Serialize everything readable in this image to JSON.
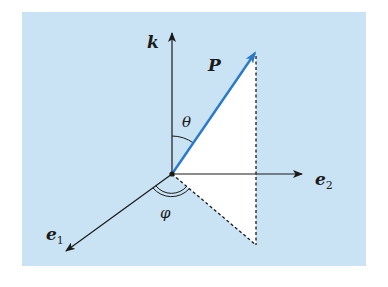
{
  "diagram": {
    "colors": {
      "background": "#c9e2f4",
      "page": "#ffffff",
      "vector": "#2a7ac8",
      "axes": "#1a1a1a",
      "projection_fill": "#ffffff"
    },
    "labels": {
      "k_axis": "k",
      "vector": "P",
      "theta": "θ",
      "e2_axis": "e",
      "e2_sub": "2",
      "e1_axis": "e",
      "e1_sub": "1",
      "phi": "φ"
    },
    "nodes": [
      {
        "id": "origin",
        "x": 172,
        "y": 174
      },
      {
        "id": "k_tip",
        "x": 172,
        "y": 33
      },
      {
        "id": "e2_tip",
        "x": 302,
        "y": 174
      },
      {
        "id": "e1_tip",
        "x": 66,
        "y": 251
      },
      {
        "id": "P_tip",
        "x": 256,
        "y": 52
      },
      {
        "id": "projection_foot",
        "x": 256,
        "y": 245
      }
    ],
    "edges": [
      {
        "from": "origin",
        "to": "k_tip",
        "style": "solid-arrow",
        "label": "k"
      },
      {
        "from": "origin",
        "to": "e2_tip",
        "style": "solid-arrow",
        "label": "e2"
      },
      {
        "from": "origin",
        "to": "e1_tip",
        "style": "solid-arrow",
        "label": "e1"
      },
      {
        "from": "origin",
        "to": "P_tip",
        "style": "blue-arrow",
        "label": "P"
      },
      {
        "from": "P_tip",
        "to": "projection_foot",
        "style": "dashed"
      },
      {
        "from": "origin",
        "to": "projection_foot",
        "style": "dashed"
      }
    ],
    "angles": [
      {
        "name": "theta",
        "between": [
          "k",
          "P"
        ],
        "arcs": 1
      },
      {
        "name": "phi",
        "between": [
          "e1",
          "projection"
        ],
        "arcs": 2
      }
    ]
  }
}
